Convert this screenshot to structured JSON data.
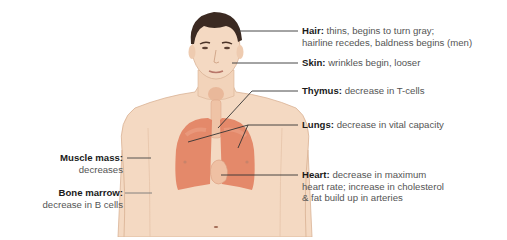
{
  "diagram": {
    "colors": {
      "skin": "#f4d9c2",
      "skin_shadow": "#e8bfa0",
      "hair": "#3b2a22",
      "organ": "#e07a5a",
      "organ_light": "#eda287",
      "leader_line": "#333333",
      "label_bold": "#1a1a1a",
      "label_text": "#555555"
    },
    "labels": [
      {
        "id": "hair",
        "title": "Hair:",
        "lines": [
          "thins, begins to turn gray;",
          "hairline recedes, baldness begins (men)"
        ],
        "side": "right"
      },
      {
        "id": "skin",
        "title": "Skin:",
        "lines": [
          "wrinkles begin, looser"
        ],
        "side": "right"
      },
      {
        "id": "thymus",
        "title": "Thymus:",
        "lines": [
          "decrease in T-cells"
        ],
        "side": "right"
      },
      {
        "id": "lungs",
        "title": "Lungs:",
        "lines": [
          "decrease in vital capacity"
        ],
        "side": "right"
      },
      {
        "id": "heart",
        "title": "Heart:",
        "lines": [
          "decrease in maximum",
          "heart rate; increase in cholesterol",
          "& fat build up in arteries"
        ],
        "side": "right"
      },
      {
        "id": "muscle",
        "title": "Muscle mass:",
        "lines": [
          "decreases"
        ],
        "side": "left"
      },
      {
        "id": "bone",
        "title": "Bone marrow:",
        "lines": [
          "decrease in B cells"
        ],
        "side": "left"
      }
    ]
  }
}
